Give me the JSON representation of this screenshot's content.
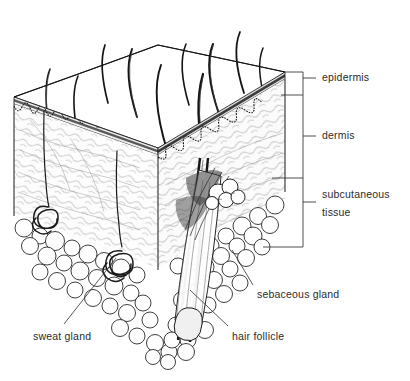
{
  "figure": {
    "type": "anatomical-line-diagram",
    "style": "pen-and-ink cutaway block",
    "background_color": "#ffffff",
    "ink_color": "#1a1a1a",
    "text_color": "#2b2b2b"
  },
  "bracket_labels": [
    {
      "id": "epidermis",
      "text": "epidermis",
      "x": 322,
      "y": 71,
      "tick_y": 78,
      "span_top": 72,
      "span_bottom": 95
    },
    {
      "id": "dermis",
      "text": "dermis",
      "x": 322,
      "y": 129,
      "tick_y": 136,
      "span_top": 95,
      "span_bottom": 178
    },
    {
      "id": "subcutaneous-tissue",
      "text": "subcutaneous",
      "text2": "tissue",
      "x": 322,
      "y": 188,
      "tick_y": 202,
      "span_top": 178,
      "span_bottom": 247
    }
  ],
  "leader_labels": [
    {
      "id": "sebaceous-gland",
      "text": "sebaceous gland",
      "x": 257,
      "y": 288
    },
    {
      "id": "sweat-gland",
      "text": "sweat gland",
      "x": 33,
      "y": 330
    },
    {
      "id": "hair-follicle",
      "text": "hair follicle",
      "x": 232,
      "y": 330
    }
  ],
  "layers": [
    {
      "name": "epidermis",
      "description": "thin outermost dark band at the cut edge"
    },
    {
      "name": "dermis",
      "description": "fibrous layer with wavy dermo-epidermal junction"
    },
    {
      "name": "subcutaneous tissue",
      "description": "lobulated fatty layer at the base"
    }
  ],
  "structures": [
    {
      "name": "hair shaft",
      "count": 10,
      "description": "hairs emerging from the top surface"
    },
    {
      "name": "hair follicle",
      "description": "large oblique follicle on the right cut face"
    },
    {
      "name": "sebaceous gland",
      "description": "lobed gland beside the follicle"
    },
    {
      "name": "sweat gland",
      "count": 2,
      "description": "coiled tubular glands at dermis base"
    }
  ]
}
